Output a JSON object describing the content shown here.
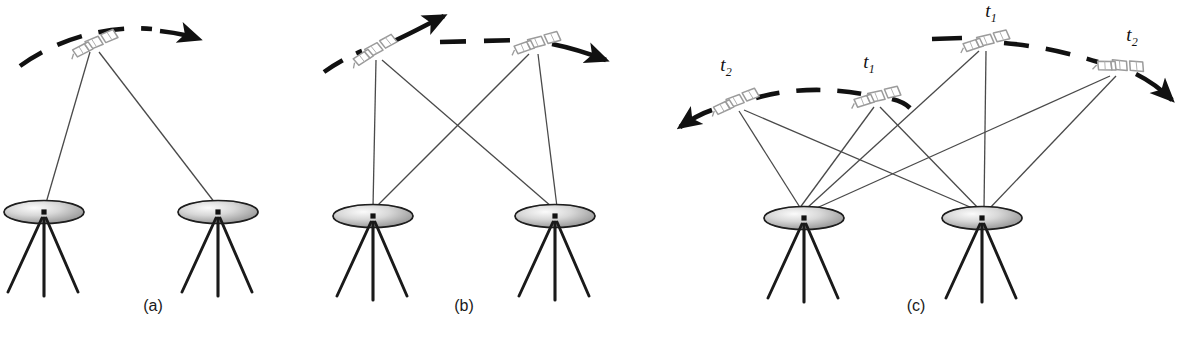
{
  "figure": {
    "background": "#ffffff",
    "width": 1189,
    "height": 342,
    "colors": {
      "orbit_dash": "#111111",
      "sight_line": "#4a4a4a",
      "dish_edge": "#1a1a1a",
      "dish_fill_light": "#f2f2f2",
      "dish_fill_dark": "#9a9a9a",
      "tripod_leg": "#1a1a1a",
      "satellite_outline": "#9b9b9b",
      "caption_text": "#1a1a1a",
      "time_label_text": "#111111"
    }
  },
  "panels": [
    {
      "id": "a",
      "caption": "(a)",
      "caption_x": 153,
      "caption_y": 307,
      "description": "One satellite observed by two ground stations",
      "orbit": {
        "dash_path": "M 22,64 C 60,38 110,26 160,30 C 205,34 230,38 196,40",
        "arrow_x": 196,
        "arrow_y": 39,
        "arrow_angle": -8
      },
      "satellites": [
        {
          "label": "",
          "x": 92,
          "y": 45,
          "angle": -14
        }
      ],
      "stations": [
        {
          "x": 44,
          "y": 212
        },
        {
          "x": 218,
          "y": 212
        }
      ],
      "sight_lines": [
        {
          "x1": 92,
          "y1": 52,
          "x2": 46,
          "y2": 205
        },
        {
          "x1": 97,
          "y1": 52,
          "x2": 216,
          "y2": 205
        }
      ]
    },
    {
      "id": "b",
      "caption": "(b)",
      "caption_x": 464,
      "caption_y": 307,
      "description": "Two satellites each observed by both ground stations, crossed sight lines",
      "satellites": [
        {
          "label": "",
          "x": 372,
          "y": 52,
          "angle": -20
        },
        {
          "label": "",
          "x": 534,
          "y": 44,
          "angle": -8
        }
      ],
      "stations": [
        {
          "x": 373,
          "y": 216
        },
        {
          "x": 555,
          "y": 216
        }
      ],
      "sight_lines": [
        {
          "x1": 376,
          "y1": 58,
          "x2": 373,
          "y2": 208
        },
        {
          "x1": 380,
          "y1": 58,
          "x2": 553,
          "y2": 208
        },
        {
          "x1": 530,
          "y1": 52,
          "x2": 375,
          "y2": 208
        },
        {
          "x1": 537,
          "y1": 52,
          "x2": 557,
          "y2": 208
        }
      ]
    },
    {
      "id": "c",
      "caption": "(c)",
      "caption_x": 916,
      "caption_y": 307,
      "description": "Two orbit tracks each sampled at two epochs t1 and t2, all observed by both stations",
      "satellites": [
        {
          "label": "t2",
          "x": 733,
          "y": 103,
          "angle": -14,
          "label_x": 726,
          "label_y": 67
        },
        {
          "label": "t1",
          "x": 874,
          "y": 98,
          "angle": -6,
          "label_x": 869,
          "label_y": 64
        },
        {
          "label": "t1",
          "x": 983,
          "y": 42,
          "angle": -7,
          "label_x": 991,
          "label_y": 12
        },
        {
          "label": "t2",
          "x": 1117,
          "y": 66,
          "angle": 14,
          "label_x": 1132,
          "label_y": 36
        }
      ],
      "stations": [
        {
          "x": 804,
          "y": 218
        },
        {
          "x": 982,
          "y": 218
        }
      ],
      "sight_lines": [
        {
          "x1": 740,
          "y1": 110,
          "x2": 802,
          "y2": 210
        },
        {
          "x1": 744,
          "y1": 110,
          "x2": 978,
          "y2": 210
        },
        {
          "x1": 876,
          "y1": 106,
          "x2": 800,
          "y2": 210
        },
        {
          "x1": 880,
          "y1": 106,
          "x2": 980,
          "y2": 210
        },
        {
          "x1": 980,
          "y1": 50,
          "x2": 806,
          "y2": 210
        },
        {
          "x1": 986,
          "y1": 50,
          "x2": 984,
          "y2": 210
        },
        {
          "x1": 1113,
          "y1": 74,
          "x2": 809,
          "y2": 212
        },
        {
          "x1": 1117,
          "y1": 74,
          "x2": 988,
          "y2": 210
        }
      ]
    }
  ],
  "time_labels": [
    {
      "text": "t",
      "sub": "2",
      "panel": "c",
      "track": "lower"
    },
    {
      "text": "t",
      "sub": "1",
      "panel": "c",
      "track": "lower"
    },
    {
      "text": "t",
      "sub": "1",
      "panel": "c",
      "track": "upper"
    },
    {
      "text": "t",
      "sub": "2",
      "panel": "c",
      "track": "upper"
    }
  ],
  "captions": [
    "(a)",
    "(b)",
    "(c)"
  ]
}
